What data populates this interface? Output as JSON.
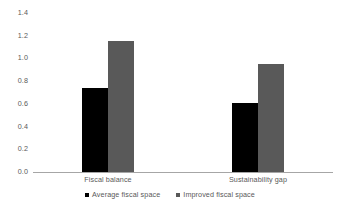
{
  "chart_data": {
    "type": "bar",
    "title": "",
    "subtitle": "",
    "xlabel": "",
    "ylabel": "",
    "categories": [
      "Fiscal balance",
      "Sustainability gap"
    ],
    "series": [
      {
        "name": "Average fiscal space",
        "color": "#000000",
        "values": [
          0.74,
          0.61
        ]
      },
      {
        "name": "Improved fiscal space",
        "color": "#595959",
        "values": [
          1.15,
          0.95
        ]
      }
    ],
    "ylim": [
      0.0,
      1.4
    ],
    "ytick_step": 0.2,
    "ytick_labels": [
      "1.4",
      "1.2",
      "1.0",
      "0.8",
      "0.6",
      "0.4",
      "0.2",
      "0.0"
    ],
    "ytick_values": [
      1.4,
      1.2,
      1.0,
      0.8,
      0.6,
      0.4,
      0.2,
      0.0
    ],
    "grid": false,
    "legend_position": "bottom",
    "axis_color": "#a6a6a6",
    "text_color": "#595959",
    "background": "#ffffff",
    "data_labels_shown": false
  }
}
